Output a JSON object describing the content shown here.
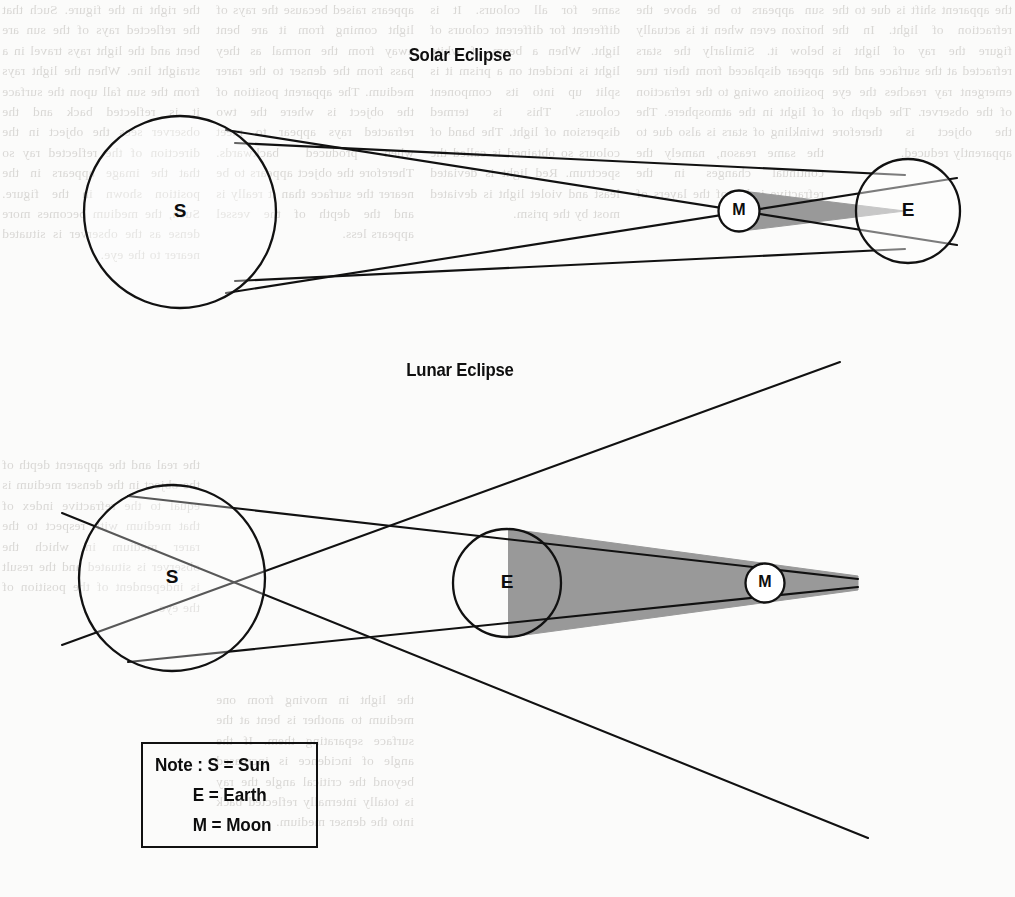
{
  "page": {
    "background_color": "#fbfbfa",
    "ink_color": "#111111",
    "shadow_fill_color": "#999999",
    "width": 1015,
    "height": 897
  },
  "diagrams": {
    "solar": {
      "title": "Solar Eclipse",
      "sun_label": "S",
      "moon_label": "M",
      "earth_label": "E"
    },
    "lunar": {
      "title": "Lunar Eclipse",
      "sun_label": "S",
      "earth_label": "E",
      "moon_label": "M"
    }
  },
  "legend": {
    "line_1": "Note : S = Sun",
    "line_2": "E = Earth",
    "line_3": "M = Moon"
  },
  "ghost_text": {
    "col_a": "the right in the figure. Such that the reflected rays of the sun are bent and the light rays travel in a straight line. When the light rays from the sun fall upon the surface it is reflected back and the observer sees the object in the direction of the reflected ray so that the image appears in the position shown in the figure. Such, the medium becomes more dense as the observer is situated nearer to the eye.",
    "col_b": "appears raised because the rays of light coming from it are bent away from the normal as they pass from the denser to the rarer medium. The apparent position of the object is where the two refracted rays appear to meet when produced backwards. Therefore the object appears to be nearer the surface than it really is and the depth of the vessel appears less.",
    "col_c": "same for all colours. It is different for different colours of light. When a beam of white light is incident on a prism it is split up into its component colours. This is termed dispersion of light. The band of colours so obtained is called the spectrum. Red light is deviated least and violet light is deviated most by the prism.",
    "col_d": "sun appears to be above the horizon even when it is actually below it. Similarly the stars appear displaced from their true positions owing to the refraction of light in the atmosphere. The twinkling of stars is also due to the same reason, namely the continual changes in the refractive index of the layers of air.",
    "col_e": "the apparent shift is due to the refraction of light. In the figure the ray of light is refracted at the surface and the emergent ray reaches the eye of the observer. The depth of the object is therefore apparently reduced.",
    "col_f": "the real and the apparent depth of the object in the denser medium is equal to the refractive index of that medium with respect to the rarer medium in which the observer is situated and the result is independent of the position of the eye.",
    "col_g": "the light in moving from one medium to another is bent at the surface separating them. If the angle of incidence is increased beyond the critical angle the ray is totally internally reflected back into the denser medium."
  }
}
